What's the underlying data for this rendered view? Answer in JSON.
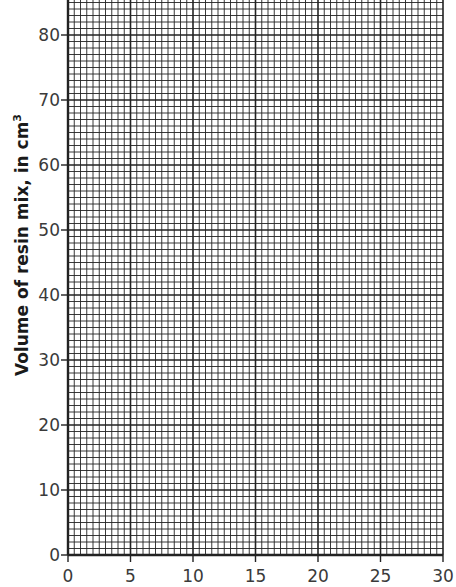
{
  "chart_data": {
    "type": "line",
    "title": "",
    "xlabel": "",
    "ylabel": "Volume of resin mix, in cm³",
    "ylabel_main": "Volume of resin mix, in cm",
    "ylabel_sup": "3",
    "xlim": [
      0,
      30
    ],
    "ylim": [
      0,
      85
    ],
    "x_ticks": [
      0,
      5,
      10,
      15,
      20,
      25,
      30
    ],
    "y_ticks": [
      0,
      10,
      20,
      30,
      40,
      50,
      60,
      70,
      80
    ],
    "x_minor_step": 0.5,
    "y_minor_step": 1,
    "grid": true,
    "series": [],
    "note": "Blank graph paper grid with no plotted data"
  },
  "layout": {
    "plot_left": 68,
    "plot_right": 443,
    "plot_bottom": 555,
    "y80_px": 35,
    "plot_top": 0,
    "line_color": "#222222",
    "background": "#ffffff"
  }
}
